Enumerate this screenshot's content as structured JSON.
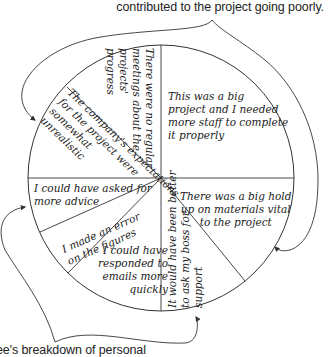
{
  "captions": {
    "top": "contributed to the project going poorly.",
    "bottom": "ee's breakdown of personal"
  },
  "pie": {
    "segments": [
      {
        "id": "no-meetings",
        "lines": [
          "There were no regular",
          "meetings about the",
          "projects'",
          "progress"
        ]
      },
      {
        "id": "big-project",
        "lines": [
          "This was a big",
          "project and I needed",
          "more staff to complete",
          "it properly"
        ]
      },
      {
        "id": "hold-up",
        "lines": [
          "There was a big hold",
          "up on materials vital",
          "to the project"
        ]
      },
      {
        "id": "ask-boss",
        "lines": [
          "It would have been better",
          "to ask my boss for",
          "support"
        ]
      },
      {
        "id": "emails",
        "lines": [
          "I could have",
          "responded to",
          "emails more",
          "quickly"
        ]
      },
      {
        "id": "error",
        "lines": [
          "I made an error",
          "on the figures"
        ]
      },
      {
        "id": "advice",
        "lines": [
          "I could have asked for",
          "more advice"
        ]
      },
      {
        "id": "expectations",
        "lines": [
          "The company's expectations",
          "for the project were",
          "somewhat",
          "unrealistic"
        ]
      }
    ]
  },
  "colors": {
    "line": "#333333",
    "text": "#222222",
    "background": "#ffffff"
  }
}
